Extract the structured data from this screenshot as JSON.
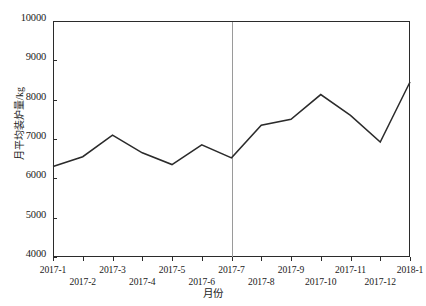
{
  "chart_data": {
    "type": "line",
    "title": "",
    "xlabel": "月份",
    "ylabel": "月平均装炉量/kg",
    "categories": [
      "2017-1",
      "2017-2",
      "2017-3",
      "2017-4",
      "2017-5",
      "2017-6",
      "2017-7",
      "2017-8",
      "2017-9",
      "2017-10",
      "2017-11",
      "2017-12",
      "2018-1"
    ],
    "values": [
      6300,
      6550,
      7100,
      6650,
      6350,
      6850,
      6520,
      7350,
      7500,
      8130,
      7600,
      6920,
      8450
    ],
    "series": [
      {
        "name": "月平均装炉量",
        "values": [
          6300,
          6550,
          7100,
          6650,
          6350,
          6850,
          6520,
          7350,
          7500,
          8130,
          7600,
          6920,
          8450
        ]
      }
    ],
    "ylim": [
      4000,
      10000
    ],
    "yticks": [
      4000,
      5000,
      6000,
      7000,
      8000,
      9000,
      10000
    ],
    "ytick_labels": [
      "4000",
      "5000",
      "6000",
      "7000",
      "8000",
      "9000",
      "10000"
    ],
    "xtick_labels": [
      "2017-1",
      "2017-2",
      "2017-3",
      "2017-4",
      "2017-5",
      "2017-6",
      "2017-7",
      "2017-8",
      "2017-9",
      "2017-10",
      "2017-11",
      "2017-12",
      "2018-1"
    ],
    "grid": false,
    "legend": "none",
    "annotations": [
      {
        "type": "vertical-reference-line",
        "at_category": "2017-7",
        "color": "#9a9a9a"
      }
    ],
    "line_color": "#2b2b2b",
    "background_color": "#ffffff",
    "axis_color": "#2b2b2b"
  }
}
